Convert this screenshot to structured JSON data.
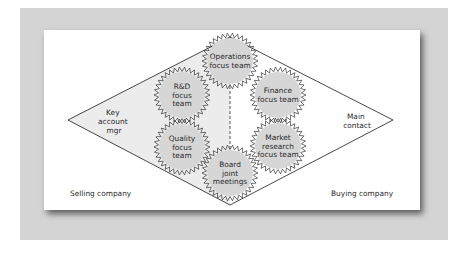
{
  "diagram": {
    "type": "diamond-relationship",
    "side_labels": {
      "left_apex": [
        "Key",
        "account",
        "mgr"
      ],
      "right_apex": [
        "Main",
        "contact"
      ],
      "bottom_left": "Selling company",
      "bottom_right": "Buying company"
    },
    "teams": [
      {
        "id": "operations",
        "lines": [
          "Operations",
          "focus team"
        ],
        "cx": 230,
        "cy": 61
      },
      {
        "id": "rnd",
        "lines": [
          "R&D",
          "focus",
          "team"
        ],
        "cx": 182,
        "cy": 95
      },
      {
        "id": "finance",
        "lines": [
          "Finance",
          "focus team"
        ],
        "cx": 278,
        "cy": 95
      },
      {
        "id": "quality",
        "lines": [
          "Quality",
          "focus",
          "team"
        ],
        "cx": 182,
        "cy": 147
      },
      {
        "id": "market-research",
        "lines": [
          "Market",
          "research",
          "focus team"
        ],
        "cx": 278,
        "cy": 146
      },
      {
        "id": "board",
        "lines": [
          "Board",
          "joint",
          "meetings"
        ],
        "cx": 230,
        "cy": 173
      }
    ],
    "colors": {
      "frame": "#d4d4d4",
      "panel": "#ffffff",
      "selling_side_fill": "#ececec",
      "gear_fill": "#d6d6d6",
      "line": "#333333"
    }
  }
}
